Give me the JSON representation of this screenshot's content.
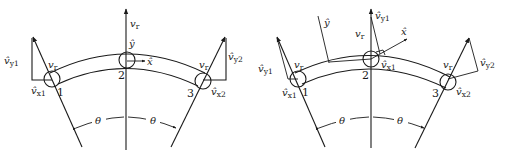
{
  "figure": {
    "panels": [
      {
        "id": "left",
        "description": "Curved beam element with nodes 1, 2, 3; nodal displacements in local x-y at node 2",
        "nodes": [
          {
            "label": "1",
            "dof_labels": {
              "x": "x1",
              "y": "y1"
            }
          },
          {
            "label": "2",
            "dof_labels": {
              "x": "x",
              "y": "y"
            }
          },
          {
            "label": "3",
            "dof_labels": {
              "x": "x2",
              "y": "y2"
            }
          }
        ],
        "labels": {
          "vr_top": "v",
          "vr_sub": "r",
          "vr_node1": "v",
          "vr_node3": "v",
          "vhat_y1": "v̂",
          "vhat_y1_sub": "y1",
          "vhat_x1": "v̂",
          "vhat_x1_sub": "x1",
          "vhat_y2": "v̂",
          "vhat_y2_sub": "y2",
          "vhat_x2": "v̂",
          "vhat_x2_sub": "x2",
          "yhat": "ŷ",
          "xhat": "x̂",
          "node1": "1",
          "node2": "2",
          "node3": "3",
          "theta_left": "θ",
          "theta_right": "θ"
        }
      },
      {
        "id": "right",
        "description": "Same curved beam with rotated local x̂-ŷ axes at node 2",
        "nodes": [
          {
            "label": "1",
            "dof_labels": {
              "x": "x1",
              "y": "y1"
            }
          },
          {
            "label": "2",
            "dof_labels": {
              "x": "x1",
              "y": "y1"
            }
          },
          {
            "label": "3",
            "dof_labels": {
              "x": "x2",
              "y": "y2"
            }
          }
        ],
        "labels": {
          "vr_top": "v",
          "vr_sub": "r",
          "vr_node1": "v",
          "vr_node3": "v",
          "vhat_y1_left": "v̂",
          "vhat_y1_left_sub": "y1",
          "vhat_x1_left": "v̂",
          "vhat_x1_left_sub": "x1",
          "vhat_y1_mid": "v̂",
          "vhat_y1_mid_sub": "y1",
          "vhat_x1_mid": "v̂",
          "vhat_x1_mid_sub": "x1",
          "vhat_y2": "v̂",
          "vhat_y2_sub": "y2",
          "vhat_x2": "v̂",
          "vhat_x2_sub": "x2",
          "yhat": "ŷ",
          "xhat": "x̂",
          "node1": "1",
          "node2": "2",
          "node3": "3",
          "theta_left": "θ",
          "theta_right": "θ"
        }
      }
    ]
  }
}
